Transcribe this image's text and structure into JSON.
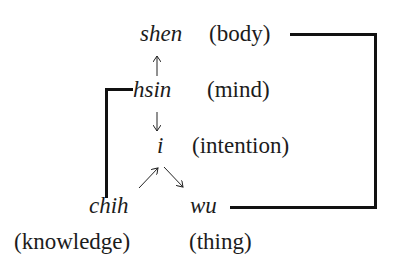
{
  "diagram": {
    "nodes": [
      {
        "id": "shen",
        "term": "shen",
        "gloss": "(body)"
      },
      {
        "id": "hsin",
        "term": "hsin",
        "gloss": "(mind)"
      },
      {
        "id": "i",
        "term": "i",
        "gloss": "(intention)"
      },
      {
        "id": "chih",
        "term": "chih",
        "gloss": "(knowledge)"
      },
      {
        "id": "wu",
        "term": "wu",
        "gloss": "(thing)"
      }
    ],
    "edges": [
      {
        "from": "hsin",
        "to": "shen",
        "type": "arrow"
      },
      {
        "from": "hsin",
        "to": "i",
        "type": "arrow"
      },
      {
        "from": "chih",
        "to": "i",
        "type": "arrow"
      },
      {
        "from": "i",
        "to": "wu",
        "type": "arrow"
      },
      {
        "from": "hsin",
        "to": "chih",
        "type": "bracket-line"
      },
      {
        "from": "shen",
        "to": "wu",
        "type": "bracket-line"
      }
    ],
    "colors": {
      "ink": "#111111",
      "background": "#ffffff"
    }
  }
}
